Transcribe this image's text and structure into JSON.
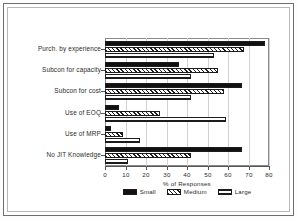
{
  "chart_data": {
    "type": "bar",
    "orientation": "horizontal",
    "title": "",
    "xlabel": "% of Responses",
    "ylabel": "",
    "xlim": [
      0,
      80
    ],
    "xticks": [
      0,
      10,
      20,
      30,
      40,
      50,
      60,
      70,
      80
    ],
    "grid": true,
    "legend_position": "bottom",
    "categories": [
      "Purch. by experience",
      "Subcon for capacity",
      "Subcon for cost",
      "Use of EOQ",
      "Use of MRP",
      "No JIT Knowledge"
    ],
    "series": [
      {
        "name": "Small",
        "pattern": "solid",
        "values": [
          78,
          36,
          67,
          7,
          3,
          67
        ]
      },
      {
        "name": "Medium",
        "pattern": "diagonal",
        "values": [
          68,
          55,
          58,
          27,
          9,
          42
        ]
      },
      {
        "name": "Large",
        "pattern": "crosshatch",
        "values": [
          53,
          42,
          42,
          59,
          17,
          11
        ]
      }
    ]
  },
  "axis": {
    "tick_labels": [
      "0",
      "10",
      "20",
      "30",
      "40",
      "50",
      "60",
      "70",
      "80"
    ],
    "x_axis_title": "% of Responses"
  },
  "legend": {
    "items": [
      {
        "label": "Small"
      },
      {
        "label": "Medium"
      },
      {
        "label": "Large"
      }
    ]
  },
  "colors": {
    "bar_fill": "#111111",
    "bar_outline": "#1c1c1c",
    "gridline": "#d2d2d2",
    "axis": "#555555",
    "text": "#2a2a2a",
    "frame_outer": "#6e6e6e",
    "frame_inner": "#b9b9b9",
    "background": "#ffffff"
  }
}
